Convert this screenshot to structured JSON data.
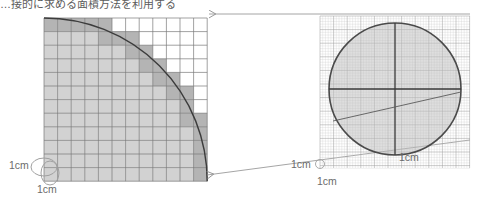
{
  "document": {
    "caption": "…接的に求める面積方法を利用する",
    "caption_color": "#5c5c5c",
    "background": "#ffffff"
  },
  "left_panel": {
    "name": "coarse-grid-quarter-circle",
    "grid": {
      "columns": 12,
      "rows": 12,
      "cell_size_cm": 1,
      "cell_px": 13.6,
      "origin_x": 44,
      "origin_y": 18,
      "line_color": "#7a7a7a",
      "fill_inside": "#d2d2d2",
      "fill_boundary": "#b4b4b4",
      "fill_outside": "#ffffff"
    },
    "arc": {
      "label": "quarter-circle-arc",
      "radius_cells": 12,
      "stroke": "#3c3c3c",
      "stroke_width": 1.4
    },
    "annotations": {
      "side_label": "1cm",
      "below_label": "1cm",
      "callout_shape": "ellipse"
    }
  },
  "right_panel": {
    "name": "fine-grid-circle",
    "grid": {
      "minor_cell_mm": 1,
      "minor_cell_px": 2.72,
      "major_every": 5,
      "origin_x": 320,
      "origin_y": 16,
      "width_px": 150,
      "height_px": 152,
      "minor_color": "#c9c9c9",
      "major_color": "#9a9a9a"
    },
    "circle": {
      "label": "measured-circle",
      "center_x": 395,
      "center_y": 89,
      "radius": 66,
      "stroke": "#4a4a4a",
      "stroke_width": 1.6,
      "fill": "#bfbfbf",
      "fill_opacity": 0.55
    },
    "axes": {
      "horizontal": "diameter-horizontal",
      "vertical": "diameter-vertical",
      "chord": "chord-diagonal",
      "stroke": "#3a3a3a"
    },
    "annotations": {
      "side_label": "1cm",
      "below_label": "1cm",
      "callout_shape": "small-circle"
    }
  },
  "connectors": {
    "top": {
      "label": "magnify-connector-top",
      "from_x": 470,
      "from_y": 14,
      "to_x": 207,
      "to_y": 14,
      "arrow_at": "left",
      "stroke": "#8e8e8e"
    },
    "bottom": {
      "label": "magnify-connector-bottom",
      "from_x": 470,
      "from_y": 140,
      "to_x": 205,
      "to_y": 176,
      "arrow_at": "left",
      "stroke": "#8e8e8e"
    },
    "scale_label": "1cm"
  }
}
